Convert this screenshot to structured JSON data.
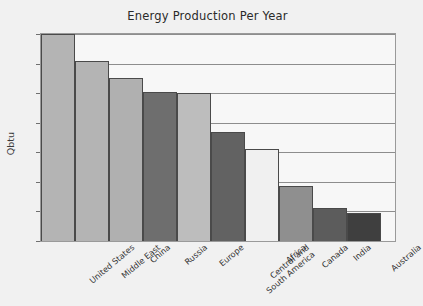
{
  "chart_data": {
    "type": "bar",
    "title": "Energy Production Per Year",
    "xlabel": "",
    "ylabel": "Qbtu",
    "categories": [
      "United States",
      "Middle East",
      "China",
      "Russia",
      "Europe",
      "Central and\nSouth America",
      "Africa",
      "Canada",
      "India",
      "Australia"
    ],
    "values": [
      70,
      61,
      55,
      50.5,
      50,
      37,
      31,
      18.5,
      11,
      9.5
    ],
    "bar_colors": [
      "#b4b4b4",
      "#b4b4b4",
      "#b0b0b0",
      "#6e6e6e",
      "#bdbdbd",
      "#626262",
      "#f0f0f0",
      "#8f8f8f",
      "#5c5c5c",
      "#3f3f3f"
    ],
    "ylim": [
      0,
      70
    ],
    "yticks": [
      0,
      10,
      20,
      30,
      40,
      50,
      60,
      70
    ],
    "ytick_labels": [
      "0",
      "10",
      "20",
      "30",
      "40",
      "50",
      "60",
      "70"
    ],
    "grid": true,
    "legend": "none",
    "bar_border_color": "#4a4a4a",
    "plot_background": "#f7f7f7",
    "page_background": "#f1f1f1"
  }
}
